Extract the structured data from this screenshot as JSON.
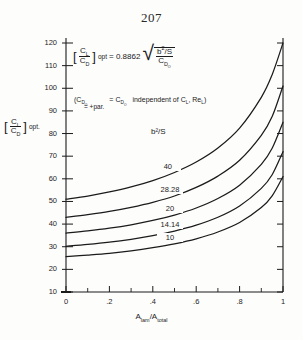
{
  "page": {
    "number": "207"
  },
  "chart_data": {
    "type": "line",
    "title": "",
    "xlabel": "A_lam/A_total",
    "ylabel": "[C_L/C_D] opt.",
    "xlim": [
      0,
      1
    ],
    "ylim": [
      10,
      120
    ],
    "grid": false,
    "legend_position": "inline-curve-labels",
    "x_tick_labels": [
      "0",
      ".2",
      ".4",
      ".6",
      ".8",
      "1"
    ],
    "x_tick_values": [
      0,
      0.2,
      0.4,
      0.6,
      0.8,
      1.0
    ],
    "x_minor_ticks": [
      0.1,
      0.3,
      0.5,
      0.7,
      0.9
    ],
    "y_tick_labels": [
      "10",
      "20",
      "30",
      "40",
      "50",
      "60",
      "70",
      "80",
      "90",
      "100",
      "110",
      "120"
    ],
    "y_tick_values": [
      10,
      20,
      30,
      40,
      50,
      60,
      70,
      80,
      90,
      100,
      110,
      120
    ],
    "series_parameter_label": "b²/S",
    "series": [
      {
        "name": "40",
        "x": [
          0,
          0.1,
          0.2,
          0.3,
          0.4,
          0.5,
          0.6,
          0.7,
          0.8,
          0.9,
          0.95,
          1.0
        ],
        "values": [
          51.0,
          52.4,
          54.2,
          56.4,
          59.2,
          62.8,
          67.4,
          73.6,
          82.4,
          96.0,
          106.0,
          120.0
        ]
      },
      {
        "name": "28.28",
        "x": [
          0,
          0.1,
          0.2,
          0.3,
          0.4,
          0.5,
          0.6,
          0.7,
          0.8,
          0.9,
          0.95,
          1.0
        ],
        "values": [
          43.0,
          44.2,
          45.6,
          47.4,
          49.6,
          52.4,
          56.2,
          61.2,
          68.2,
          79.2,
          87.5,
          101.0
        ]
      },
      {
        "name": "20",
        "x": [
          0,
          0.1,
          0.2,
          0.3,
          0.4,
          0.5,
          0.6,
          0.7,
          0.8,
          0.9,
          0.95,
          1.0
        ],
        "values": [
          36.0,
          37.0,
          38.2,
          39.7,
          41.6,
          44.0,
          47.1,
          51.3,
          57.2,
          66.4,
          73.5,
          85.0
        ]
      },
      {
        "name": "14.14",
        "x": [
          0,
          0.1,
          0.2,
          0.3,
          0.4,
          0.5,
          0.6,
          0.7,
          0.8,
          0.9,
          0.95,
          1.0
        ],
        "values": [
          30.2,
          31.0,
          32.0,
          33.3,
          34.9,
          36.9,
          39.5,
          43.0,
          48.0,
          55.8,
          61.8,
          72.0
        ]
      },
      {
        "name": "10",
        "x": [
          0,
          0.1,
          0.2,
          0.3,
          0.4,
          0.5,
          0.6,
          0.7,
          0.8,
          0.9,
          0.95,
          1.0
        ],
        "values": [
          25.6,
          26.3,
          27.1,
          28.2,
          29.6,
          31.3,
          33.5,
          36.5,
          40.7,
          47.3,
          52.5,
          61.0
        ]
      }
    ],
    "annotations": {
      "formula": {
        "bracket_num": "C",
        "bracket_num_sub": "L",
        "bracket_den": "C",
        "bracket_den_sub": "D",
        "opt": "opt",
        "equals": "= 0.8862",
        "coefficient": "0.8862",
        "radicand_num": "b",
        "radicand_num_sup": "2",
        "radicand_num_tail": "/S",
        "radicand_den": "C",
        "radicand_den_sub": "D",
        "radicand_den_sub2": "O"
      },
      "note": {
        "open": "(C",
        "open_sub": "D",
        "open_sub2": "O",
        "under": "= +par.",
        "mid": "= C",
        "mid_sub": "D",
        "mid_sub2": "O",
        "tail": "independent of C",
        "tail_sub": "L",
        "tail_mid": ", Re",
        "tail_sub2": "L",
        "close": ")"
      },
      "series_header": "b²/S",
      "curve_labels": [
        "40",
        "28.28",
        "20",
        "14.14",
        "10"
      ],
      "x_axis_title_num": "A",
      "x_axis_title_num_sub": "lam",
      "x_axis_title_den": "A",
      "x_axis_title_den_sub": "total",
      "y_axis_title_num": "C",
      "y_axis_title_num_sub": "L",
      "y_axis_title_den": "C",
      "y_axis_title_den_sub": "D",
      "y_axis_title_opt": "opt."
    },
    "colors": {
      "ink": "#1b1b1b",
      "paper": "#fdfdfc"
    }
  }
}
